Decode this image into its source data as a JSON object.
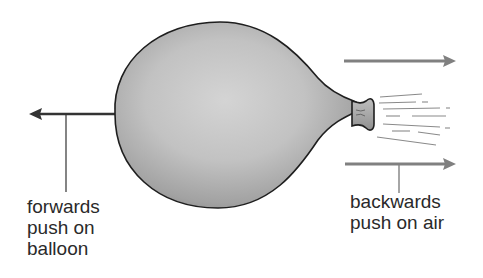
{
  "diagram": {
    "subject": "balloon",
    "labels": {
      "forwards_push": [
        "forwards",
        "push on",
        "balloon"
      ],
      "backwards_push": [
        "backwards",
        "push on air"
      ]
    },
    "arrows": [
      {
        "name": "forwards-push-arrow",
        "direction": "left"
      },
      {
        "name": "backwards-push-arrow-top",
        "direction": "right"
      },
      {
        "name": "backwards-push-arrow-bottom",
        "direction": "right"
      }
    ],
    "colors": {
      "arrow_dark": "#333333",
      "arrow_gray": "#808080",
      "balloon_fill_light": "#cfcfcf",
      "balloon_fill_dark": "#8e8e8e",
      "outline": "#1e1e1e",
      "text": "#2a2a2a"
    }
  }
}
